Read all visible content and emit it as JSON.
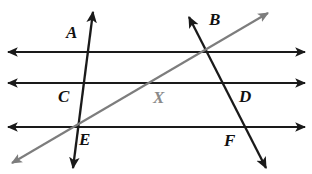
{
  "diagram": {
    "background_color": "#ffffff",
    "line_color": "#1a1a1a",
    "diagonal_color": "#7d7d7d",
    "labels": [
      {
        "id": "label-a",
        "text": "A",
        "x": 66,
        "y": 24,
        "color": "#111111"
      },
      {
        "id": "label-b",
        "text": "B",
        "x": 209,
        "y": 11,
        "color": "#111111"
      },
      {
        "id": "label-c",
        "text": "C",
        "x": 58,
        "y": 88,
        "color": "#111111"
      },
      {
        "id": "label-d",
        "text": "D",
        "x": 239,
        "y": 88,
        "color": "#111111"
      },
      {
        "id": "label-e",
        "text": "E",
        "x": 79,
        "y": 131,
        "color": "#111111"
      },
      {
        "id": "label-f",
        "text": "F",
        "x": 224,
        "y": 132,
        "color": "#111111"
      },
      {
        "id": "label-x",
        "text": "X",
        "x": 153,
        "y": 89,
        "color": "#8a8a8a"
      }
    ],
    "parallel_lines": [
      {
        "id": "line-top",
        "y": 52,
        "x_start": 8,
        "x_end": 305
      },
      {
        "id": "line-middle",
        "y": 83,
        "x_start": 8,
        "x_end": 305
      },
      {
        "id": "line-bottom",
        "y": 127,
        "x_start": 8,
        "x_end": 305
      }
    ],
    "transversals": [
      {
        "id": "transversal-left",
        "x1": 93,
        "y1": 12,
        "x2": 73,
        "y2": 168
      },
      {
        "id": "transversal-right",
        "x1": 189,
        "y1": 17,
        "x2": 266,
        "y2": 168
      }
    ],
    "diagonal_ray": {
      "id": "diagonal-gray",
      "x1": 12,
      "y1": 163,
      "x2": 268,
      "y2": 13
    },
    "intersections": [
      {
        "name": "A",
        "x": 90,
        "y": 52
      },
      {
        "name": "B",
        "x": 208,
        "y": 52
      },
      {
        "name": "C",
        "x": 86,
        "y": 83
      },
      {
        "name": "D",
        "x": 223,
        "y": 83
      },
      {
        "name": "E",
        "x": 80,
        "y": 127
      },
      {
        "name": "F",
        "x": 246,
        "y": 127
      },
      {
        "name": "X",
        "x": 160,
        "y": 83
      }
    ]
  }
}
